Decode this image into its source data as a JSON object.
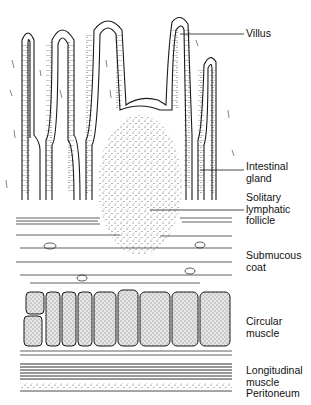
{
  "diagram": {
    "colors": {
      "ink": "#1a1a1a",
      "background": "#ffffff",
      "stipple": "#555555"
    },
    "labels": [
      {
        "id": "villus",
        "text": "Villus",
        "top": 28
      },
      {
        "id": "intestinal-gland",
        "text": "Intestinal\ngland",
        "top": 162
      },
      {
        "id": "solitary-lymphatic-follicle",
        "text": "Solitary\nlymphatic\nfollicle",
        "top": 193
      },
      {
        "id": "submucous-coat",
        "text": "Submucous\ncoat",
        "top": 250
      },
      {
        "id": "circular-muscle",
        "text": "Circular\nmuscle",
        "top": 316
      },
      {
        "id": "longitudinal-muscle",
        "text": "Longitudinal\nmuscle",
        "top": 365
      },
      {
        "id": "peritoneum",
        "text": "Peritoneum",
        "top": 389
      }
    ]
  }
}
